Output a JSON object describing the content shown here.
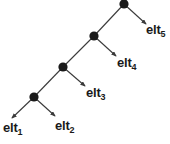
{
  "diagram": {
    "type": "tree-with-leaf-arrows",
    "background_color": "#ffffff",
    "stroke_color": "#3a3a3a",
    "node_color": "#1a1a1a",
    "text_color": "#1a1a1a",
    "nodes": [
      {
        "id": "n1",
        "x": 34,
        "y": 97,
        "r": 4.6
      },
      {
        "id": "n2",
        "x": 63,
        "y": 67,
        "r": 4.6
      },
      {
        "id": "n3",
        "x": 94,
        "y": 36,
        "r": 4.6
      },
      {
        "id": "n4",
        "x": 124,
        "y": 4,
        "r": 4.6
      }
    ],
    "spine_edges": [
      {
        "from": "n1",
        "to": "n2",
        "x1": 34,
        "y1": 97,
        "x2": 63,
        "y2": 67
      },
      {
        "from": "n2",
        "to": "n3",
        "x1": 63,
        "y1": 67,
        "x2": 94,
        "y2": 36
      },
      {
        "from": "n3",
        "to": "n4",
        "x1": 94,
        "y1": 36,
        "x2": 124,
        "y2": 4
      }
    ],
    "leaf_arrows": [
      {
        "id": "a1",
        "from": "n1",
        "x1": 34,
        "y1": 97,
        "x2": 12,
        "y2": 118
      },
      {
        "id": "a2",
        "from": "n1",
        "x1": 34,
        "y1": 97,
        "x2": 55,
        "y2": 116
      },
      {
        "id": "a3",
        "from": "n2",
        "x1": 63,
        "y1": 67,
        "x2": 85,
        "y2": 86
      },
      {
        "id": "a4",
        "from": "n3",
        "x1": 94,
        "y1": 36,
        "x2": 116,
        "y2": 56
      },
      {
        "id": "a5",
        "from": "n4",
        "x1": 124,
        "y1": 4,
        "x2": 146,
        "y2": 24
      }
    ],
    "labels": [
      {
        "id": "l1",
        "base": "elt",
        "sub": "1",
        "x": 3,
        "y": 121
      },
      {
        "id": "l2",
        "base": "elt",
        "sub": "2",
        "x": 55,
        "y": 119
      },
      {
        "id": "l3",
        "base": "elt",
        "sub": "3",
        "x": 86,
        "y": 86
      },
      {
        "id": "l4",
        "base": "elt",
        "sub": "4",
        "x": 117,
        "y": 56
      },
      {
        "id": "l5",
        "base": "elt",
        "sub": "5",
        "x": 146,
        "y": 23
      }
    ]
  }
}
